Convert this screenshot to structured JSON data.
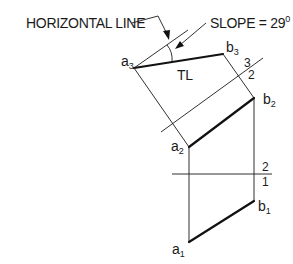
{
  "diagram": {
    "type": "auxiliary-view-construction",
    "annotations": {
      "horizontal_line": "HORIZONTAL LINE",
      "slope": "SLOPE = 29",
      "slope_degree": "0",
      "true_length": "TL"
    },
    "points": {
      "a3": {
        "base": "a",
        "sub": "3"
      },
      "b3": {
        "base": "b",
        "sub": "3"
      },
      "a2": {
        "base": "a",
        "sub": "2"
      },
      "b2": {
        "base": "b",
        "sub": "2"
      },
      "a1": {
        "base": "a",
        "sub": "1"
      },
      "b1": {
        "base": "b",
        "sub": "1"
      }
    },
    "fold_lines": {
      "f32": {
        "upper": "3",
        "lower": "2"
      },
      "f21": {
        "upper": "2",
        "lower": "1"
      }
    },
    "colors": {
      "line": "#1a1a1a",
      "background": "#ffffff"
    }
  }
}
